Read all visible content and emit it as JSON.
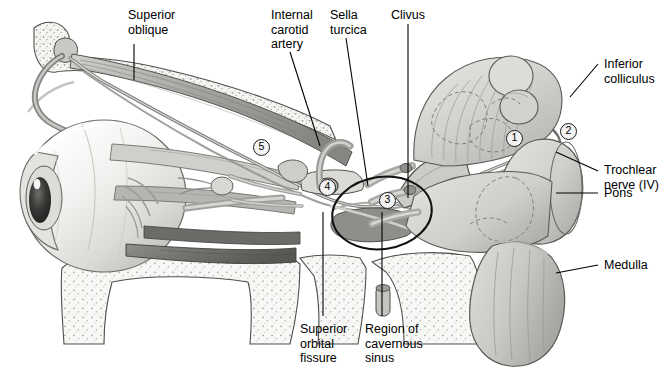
{
  "figure": {
    "background_color": "#ffffff",
    "width": 662,
    "height": 369,
    "line_color": "#000000"
  },
  "labels": [
    {
      "id": "superior-oblique",
      "text": "Superior\noblique",
      "x": 128,
      "y": 8,
      "align": "left"
    },
    {
      "id": "internal-carotid-artery",
      "text": "Internal\ncarotid\nartery",
      "x": 271,
      "y": 8,
      "align": "left"
    },
    {
      "id": "sella-turcica",
      "text": "Sella\nturcica",
      "x": 330,
      "y": 8,
      "align": "left"
    },
    {
      "id": "clivus",
      "text": "Clivus",
      "x": 391,
      "y": 8,
      "align": "left"
    },
    {
      "id": "inferior-colliculus",
      "text": "Inferior\ncolliculus",
      "x": 604,
      "y": 57,
      "align": "left"
    },
    {
      "id": "trochlear-nerve",
      "text": "Trochlear\nnerve (IV)",
      "x": 604,
      "y": 163,
      "align": "left"
    },
    {
      "id": "pons",
      "text": "Pons",
      "x": 604,
      "y": 186,
      "align": "left"
    },
    {
      "id": "medulla",
      "text": "Medulla",
      "x": 604,
      "y": 258,
      "align": "left"
    },
    {
      "id": "superior-orbital-fissure",
      "text": "Superior\norbital\nfissure",
      "x": 300,
      "y": 322,
      "align": "left"
    },
    {
      "id": "region-of-cavernous-sinus",
      "text": "Region of\ncavernous\nsinus",
      "x": 365,
      "y": 322,
      "align": "left"
    }
  ],
  "markers": [
    {
      "id": "marker-1",
      "number": "1",
      "x": 506,
      "y": 130
    },
    {
      "id": "marker-2",
      "number": "2",
      "x": 560,
      "y": 123
    },
    {
      "id": "marker-3",
      "number": "3",
      "x": 379,
      "y": 192
    },
    {
      "id": "marker-4",
      "number": "4",
      "x": 319,
      "y": 179
    },
    {
      "id": "marker-5",
      "number": "5",
      "x": 253,
      "y": 139
    }
  ],
  "leaders": [
    {
      "id": "leader-superior-oblique",
      "points": "134,44 134,80"
    },
    {
      "id": "leader-internal-carotid",
      "points": "290,52 320,146"
    },
    {
      "id": "leader-sella-turcica",
      "points": "346,38 368,186"
    },
    {
      "id": "leader-clivus",
      "points": "408,24 408,198"
    },
    {
      "id": "leader-inferior-colliculus",
      "points": "598,64 570,97"
    },
    {
      "id": "leader-trochlear-nerve",
      "points": "598,171 556,152"
    },
    {
      "id": "leader-pons",
      "points": "598,193 556,193"
    },
    {
      "id": "leader-medulla",
      "points": "598,265 556,273"
    },
    {
      "id": "leader-superior-orbital",
      "points": "323,316 323,212"
    },
    {
      "id": "leader-cavernous-sinus",
      "points": "382,316 382,212"
    }
  ],
  "annotations": {
    "cavernous_sinus_ellipse": {
      "cx": 382,
      "cy": 213,
      "rx": 50,
      "ry": 36,
      "rotation": -8
    }
  },
  "palette": {
    "bone_fill": "#f4f4f2",
    "bone_stipple": "#b8b8b4",
    "muscle_light": "#d9d9d6",
    "muscle_mid": "#a8a8a4",
    "muscle_dark": "#7d7d7a",
    "brainstem": "#d5d5d2",
    "brainstem_shade": "#bcbcb8",
    "globe": "#ededea",
    "pupil": "#141414",
    "outline": "#5a5a57"
  }
}
